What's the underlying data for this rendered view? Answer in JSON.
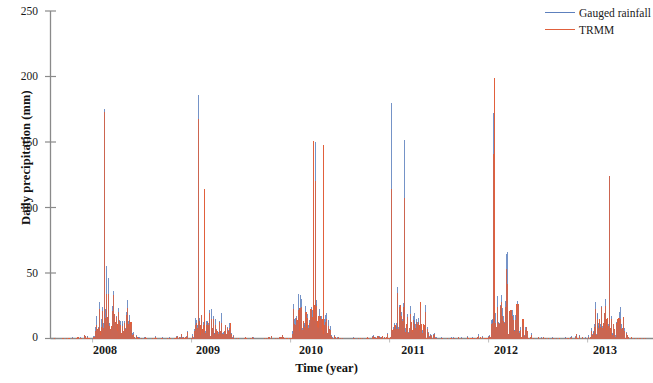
{
  "chart_data": {
    "type": "line",
    "title": "",
    "subtitle": "",
    "xlabel": "Time (year)",
    "ylabel": "Daily precipitation (mm)",
    "xlim": [
      2007.58,
      2013.62
    ],
    "ylim": [
      0,
      250
    ],
    "grid": false,
    "legend_position": "top-right",
    "x_tick_labels": [
      "2008",
      "2009",
      "2010",
      "2011",
      "2012",
      "2013"
    ],
    "x_tick_values": [
      2008,
      2009,
      2010,
      2011,
      2012,
      2013
    ],
    "y_tick_labels": [
      "0",
      "50",
      "100",
      "150",
      "200",
      "250"
    ],
    "y_tick_values": [
      0,
      50,
      100,
      150,
      200,
      250
    ],
    "series": [
      {
        "name": "Gauged rainfall",
        "color": "#5d80bd",
        "notes": "Daily gauged station rainfall, mm/day; peaks reach ~186 mm (early 2009), ~180 mm (early 2011), ~175 mm (early 2008), ~172 mm (early 2012)",
        "peak_values": [
          175,
          186,
          150,
          180,
          172,
          124
        ],
        "peak_years": [
          2008.12,
          2009.07,
          2010.25,
          2011.02,
          2012.05,
          2013.22
        ]
      },
      {
        "name": "TRMM",
        "color": "#e0603c",
        "notes": "TRMM satellite daily precipitation estimate, mm/day; peaks reach ~199 mm (early 2012), ~173 mm (early 2008), ~151 mm (early 2010)",
        "peak_values": [
          173,
          114,
          151,
          148,
          199,
          124
        ],
        "peak_years": [
          2008.12,
          2009.13,
          2010.23,
          2010.33,
          2012.06,
          2013.22
        ]
      }
    ],
    "annual_wet_season_peaks": [
      {
        "year": 2008,
        "gauged_max": 175,
        "trmm_max": 173
      },
      {
        "year": 2009,
        "gauged_max": 186,
        "trmm_max": 114
      },
      {
        "year": 2010,
        "gauged_max": 150,
        "trmm_max": 151
      },
      {
        "year": 2011,
        "gauged_max": 180,
        "trmm_max": 148
      },
      {
        "year": 2012,
        "gauged_max": 172,
        "trmm_max": 199
      },
      {
        "year": 2013,
        "gauged_max": 124,
        "trmm_max": 124
      }
    ]
  },
  "legend": {
    "items": [
      {
        "label": "Gauged rainfall",
        "color": "#5d80bd"
      },
      {
        "label": "TRMM",
        "color": "#e0603c"
      }
    ]
  },
  "axes": {
    "ylabel": "Daily precipitation (mm)",
    "xlabel": "Time (year)",
    "yticks": [
      "250",
      "200",
      "150",
      "100",
      "50",
      "0"
    ],
    "xticks": [
      "2008",
      "2009",
      "2010",
      "2011",
      "2012",
      "2013"
    ]
  }
}
